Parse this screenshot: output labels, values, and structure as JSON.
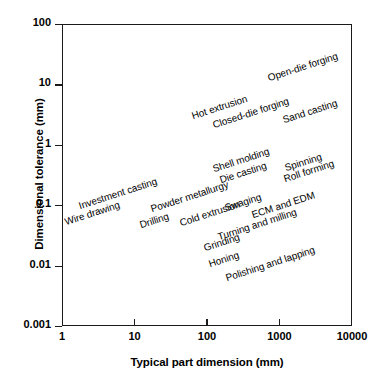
{
  "chart_data": {
    "type": "scatter",
    "title": "",
    "xlabel": "Typical part dimension (mm)",
    "ylabel": "Dimensional tolerance (mm)",
    "xscale": "log",
    "yscale": "log",
    "xlim": [
      1,
      10000
    ],
    "ylim": [
      0.001,
      100
    ],
    "grid": false,
    "legend": null,
    "xticks": [
      "1",
      "10",
      "100",
      "1000",
      "10000"
    ],
    "yticks": [
      "100",
      "10",
      "1",
      "0.1",
      "0.01",
      "0.001"
    ],
    "annotations": [
      {
        "text": "Open-die forging",
        "x": 700,
        "y": 13.0,
        "rotation": -18
      },
      {
        "text": "Hot extrusion",
        "x": 62,
        "y": 3.0,
        "rotation": -18
      },
      {
        "text": "Closed-die forging",
        "x": 120,
        "y": 2.1,
        "rotation": -18
      },
      {
        "text": "Sand casting",
        "x": 1100,
        "y": 2.6,
        "rotation": -18
      },
      {
        "text": "Shell molding",
        "x": 120,
        "y": 0.4,
        "rotation": -18
      },
      {
        "text": "Die casting",
        "x": 150,
        "y": 0.26,
        "rotation": -18
      },
      {
        "text": "Spinning",
        "x": 1200,
        "y": 0.42,
        "rotation": -18
      },
      {
        "text": "Roll forming",
        "x": 1150,
        "y": 0.27,
        "rotation": -18
      },
      {
        "text": "Investment casting",
        "x": 1.7,
        "y": 0.098,
        "rotation": -18
      },
      {
        "text": "Powder metallurgy",
        "x": 17,
        "y": 0.086,
        "rotation": -18
      },
      {
        "text": "Swaging",
        "x": 175,
        "y": 0.09,
        "rotation": -18
      },
      {
        "text": "Wire drawing",
        "x": 1.1,
        "y": 0.052,
        "rotation": -18
      },
      {
        "text": "Drilling",
        "x": 12,
        "y": 0.047,
        "rotation": -18
      },
      {
        "text": "Cold extrusion",
        "x": 42,
        "y": 0.05,
        "rotation": -18
      },
      {
        "text": "ECM and EDM",
        "x": 420,
        "y": 0.07,
        "rotation": -18
      },
      {
        "text": "Turning and milling",
        "x": 140,
        "y": 0.03,
        "rotation": -18
      },
      {
        "text": "Grinding",
        "x": 90,
        "y": 0.0195,
        "rotation": -18
      },
      {
        "text": "Honing",
        "x": 105,
        "y": 0.0105,
        "rotation": -18
      },
      {
        "text": "Polishing and lapping",
        "x": 180,
        "y": 0.0062,
        "rotation": -18
      }
    ]
  }
}
